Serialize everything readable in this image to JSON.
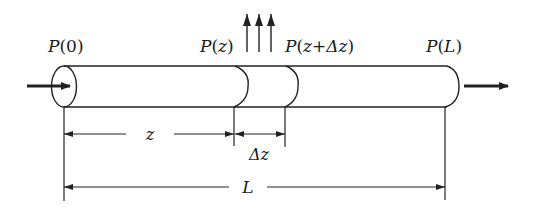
{
  "diagram": {
    "type": "pipe-flow-schematic",
    "colors": {
      "stroke": "#222222",
      "background": "#ffffff"
    },
    "labels": {
      "p0": {
        "fn": "P",
        "open": "(",
        "arg": "0",
        "close": ")"
      },
      "pz": {
        "fn": "P",
        "open": "(",
        "arg": "z",
        "close": ")"
      },
      "pzdz": {
        "fn": "P",
        "open": "(",
        "arg1": "z",
        "plus": "+",
        "arg2": "Δz",
        "close": ")"
      },
      "pL": {
        "fn": "P",
        "open": "(",
        "arg": "L",
        "close": ")"
      },
      "dim_z": "z",
      "dim_dz": "Δz",
      "dim_L": "L"
    },
    "elements": {
      "input_arrow": "arrow-right",
      "output_arrow": "arrow-right",
      "loss_arrows_count": 3
    }
  }
}
